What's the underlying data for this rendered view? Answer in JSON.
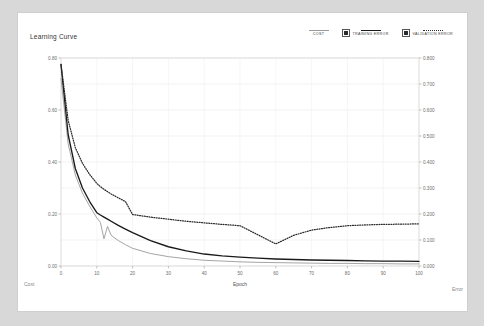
{
  "card": {
    "title": "Learning Curve",
    "bottom_left_label": "Cost",
    "bottom_right_label": "Error"
  },
  "legend": {
    "position": "top-right",
    "items": [
      {
        "label": "COST",
        "style": "solid",
        "color": "#9a9a9a",
        "has_checkbox": false
      },
      {
        "label": "TRAINING ERROR",
        "style": "solid",
        "color": "#1a1a1a",
        "has_checkbox": true
      },
      {
        "label": "VALIDATION ERROR",
        "style": "dotted",
        "color": "#2b2b2b",
        "has_checkbox": true
      }
    ]
  },
  "chart_data": {
    "type": "line",
    "title": "Learning Curve",
    "xlabel": "Epoch",
    "ylabel": "Cost",
    "y2label": "Error",
    "xlim": [
      0,
      100
    ],
    "ylim": [
      0.0,
      0.8
    ],
    "y2lim": [
      0.0,
      0.8
    ],
    "grid": true,
    "legend_position": "top-right",
    "xticks": [
      0,
      10,
      20,
      30,
      40,
      50,
      60,
      70,
      80,
      90,
      100
    ],
    "xtick_labels": [
      "0",
      "10",
      "20",
      "30",
      "40",
      "50",
      "60",
      "70",
      "80",
      "90",
      "100"
    ],
    "yticks": [
      0.0,
      0.2,
      0.4,
      0.6,
      0.8
    ],
    "ytick_labels": [
      "0.00",
      "0.20",
      "0.40",
      "0.60",
      "0.80"
    ],
    "y2ticks": [
      0.0,
      0.1,
      0.2,
      0.3,
      0.4,
      0.5,
      0.6,
      0.7,
      0.8
    ],
    "y2tick_labels": [
      "0.000",
      "0.100",
      "0.200",
      "0.300",
      "0.400",
      "0.500",
      "0.600",
      "0.700",
      "0.800"
    ],
    "x": [
      0,
      2,
      4,
      6,
      8,
      10,
      11,
      12,
      13,
      14,
      16,
      18,
      20,
      25,
      30,
      35,
      40,
      45,
      50,
      55,
      60,
      65,
      70,
      75,
      80,
      85,
      90,
      95,
      100
    ],
    "series": [
      {
        "name": "COST",
        "axis": "left",
        "style": "solid",
        "color": "#9a9a9a",
        "values": [
          0.72,
          0.47,
          0.35,
          0.28,
          0.23,
          0.185,
          0.168,
          0.105,
          0.152,
          0.118,
          0.098,
          0.082,
          0.068,
          0.048,
          0.036,
          0.028,
          0.022,
          0.019,
          0.016,
          0.014,
          0.013,
          0.012,
          0.011,
          0.01,
          0.01,
          0.009,
          0.009,
          0.008,
          0.008
        ]
      },
      {
        "name": "TRAINING ERROR",
        "axis": "right",
        "style": "solid",
        "color": "#1a1a1a",
        "values": [
          0.775,
          0.505,
          0.375,
          0.3,
          0.248,
          0.205,
          0.196,
          0.188,
          0.18,
          0.172,
          0.156,
          0.142,
          0.128,
          0.098,
          0.074,
          0.058,
          0.046,
          0.039,
          0.034,
          0.03,
          0.027,
          0.025,
          0.023,
          0.022,
          0.021,
          0.02,
          0.019,
          0.019,
          0.018
        ]
      },
      {
        "name": "VALIDATION ERROR",
        "axis": "right",
        "style": "dotted",
        "color": "#2b2b2b",
        "values": [
          0.775,
          0.56,
          0.455,
          0.395,
          0.352,
          0.318,
          0.305,
          0.295,
          0.286,
          0.277,
          0.262,
          0.248,
          0.198,
          0.188,
          0.18,
          0.172,
          0.166,
          0.16,
          0.155,
          0.12,
          0.085,
          0.118,
          0.138,
          0.148,
          0.155,
          0.158,
          0.16,
          0.161,
          0.162
        ]
      }
    ]
  }
}
